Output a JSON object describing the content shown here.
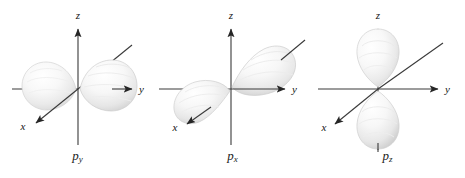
{
  "figure": {
    "name": "p-orbital-shapes-figure",
    "background_color": "#ffffff",
    "width": 465,
    "height": 178,
    "panel_count": 3
  },
  "style": {
    "axis_color": "#3a3a3a",
    "lobe_fill_light": "#fdfdfd",
    "lobe_fill_mid": "#ededed",
    "lobe_fill_shadow": "#d8d8d8",
    "lobe_outline": "#cfcfcf",
    "label_color": "#1a1a1a"
  },
  "panels": [
    {
      "id": "panel-py",
      "orbital_symbol": "p",
      "orbital_subscript": "y",
      "caption": "py",
      "axes": [
        {
          "name": "z",
          "label": "z",
          "direction": "up",
          "arrow": true
        },
        {
          "name": "y",
          "label": "y",
          "direction": "right",
          "arrow": true
        },
        {
          "name": "x",
          "label": "x",
          "direction": "down-left",
          "arrow": true
        }
      ],
      "lobes": [
        {
          "name": "lobe-y-positive",
          "orientation": "right",
          "along_axis": "y"
        },
        {
          "name": "lobe-y-negative",
          "orientation": "left",
          "along_axis": "y"
        }
      ]
    },
    {
      "id": "panel-px",
      "orbital_symbol": "p",
      "orbital_subscript": "x",
      "caption": "px",
      "axes": [
        {
          "name": "z",
          "label": "z",
          "direction": "up",
          "arrow": true
        },
        {
          "name": "y",
          "label": "y",
          "direction": "right",
          "arrow": true
        },
        {
          "name": "x",
          "label": "x",
          "direction": "down-left",
          "arrow": true
        }
      ],
      "lobes": [
        {
          "name": "lobe-x-negative",
          "orientation": "lower-left",
          "along_axis": "x"
        },
        {
          "name": "lobe-x-positive",
          "orientation": "upper-right",
          "along_axis": "x"
        }
      ]
    },
    {
      "id": "panel-pz",
      "orbital_symbol": "p",
      "orbital_subscript": "z",
      "caption": "pz",
      "axes": [
        {
          "name": "z",
          "label": "z",
          "direction": "up",
          "arrow": true
        },
        {
          "name": "y",
          "label": "y",
          "direction": "right",
          "arrow": true
        },
        {
          "name": "x",
          "label": "x",
          "direction": "down-left",
          "arrow": true
        }
      ],
      "lobes": [
        {
          "name": "lobe-z-positive",
          "orientation": "up",
          "along_axis": "z"
        },
        {
          "name": "lobe-z-negative",
          "orientation": "down",
          "along_axis": "z"
        }
      ]
    }
  ],
  "axis_labels": {
    "z": "z",
    "y": "y",
    "x": "x"
  }
}
